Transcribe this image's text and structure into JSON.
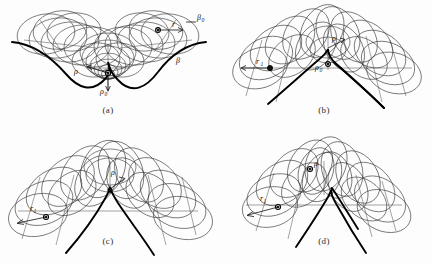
{
  "figure": {
    "title": "",
    "background_color": "#fdfdfd",
    "ink_color": "#2e2e2e",
    "envelope_color": "#000000",
    "panel_count": 4
  },
  "panels": [
    {
      "id": "a",
      "caption": "(a)",
      "description": "Family of circles of constant radius centred on a curve, envelope is a concave double-lobed curve with a central cusp pointing upward",
      "envelope_shape": "concave-two-lobe",
      "labels": [
        {
          "name": "rho",
          "text": "ρ",
          "x": 72,
          "y": 74
        },
        {
          "name": "rho-zero",
          "text": "ρ",
          "sub": "0",
          "x": 100,
          "y": 93
        },
        {
          "name": "r",
          "text": "r",
          "x": 174,
          "y": 29
        },
        {
          "name": "beta-zero",
          "text": "β",
          "sub": "0",
          "x": 197,
          "y": 19
        },
        {
          "name": "beta",
          "text": "β",
          "x": 175,
          "y": 62
        }
      ]
    },
    {
      "id": "b",
      "caption": "(b)",
      "description": "Family of circles whose envelope is a convex arch with a small cusp at the apex; generating circle centres lie on an arc",
      "envelope_shape": "convex-arch-with-apex-cusp",
      "labels": [
        {
          "name": "r-one",
          "text": "r",
          "sub": "1",
          "x": 42,
          "y": 64
        },
        {
          "name": "rho",
          "text": "ρ",
          "x": 118,
          "y": 40
        },
        {
          "name": "rho-zero",
          "text": "ρ",
          "sub": "0",
          "x": 102,
          "y": 67
        }
      ]
    },
    {
      "id": "c",
      "caption": "(c)",
      "description": "Family of circles forming a broad arch envelope with a sharp downward cusp at the apex",
      "envelope_shape": "broad-arch-sharp-cusp",
      "labels": [
        {
          "name": "r-one",
          "text": "r",
          "sub": "1",
          "x": 30,
          "y": 110
        },
        {
          "name": "rho",
          "text": "ρ",
          "x": 110,
          "y": 42
        }
      ]
    },
    {
      "id": "d",
      "caption": "(d)",
      "description": "Skewed family of circles with an asymmetric envelope and an oblique cusp",
      "envelope_shape": "skewed-asymmetric-cusp",
      "labels": [
        {
          "name": "r-one",
          "text": "r",
          "sub": "1",
          "x": 38,
          "y": 84
        },
        {
          "name": "rho",
          "text": "ρ",
          "x": 98,
          "y": 35
        }
      ]
    }
  ],
  "symbols": {
    "rho": "ρ",
    "rho_zero": "ρ₀",
    "r": "r",
    "r_one": "r₁",
    "beta": "β",
    "beta_zero": "β₀"
  }
}
